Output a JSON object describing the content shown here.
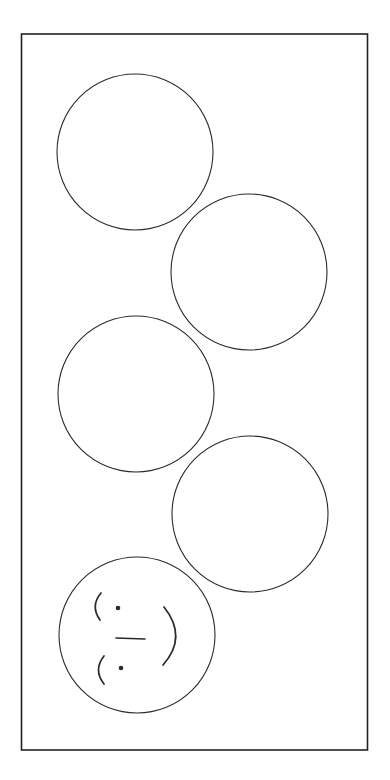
{
  "colors": {
    "background": "#ffffff",
    "stroke": "#2a2a2a",
    "frame_stroke": "#222222"
  },
  "frame": {
    "x": 21.5,
    "y": 34,
    "width": 346,
    "height": 716,
    "stroke_width": 1.6
  },
  "circles": [
    {
      "id": "circle-1",
      "cx": 135,
      "cy": 152,
      "r": 78
    },
    {
      "id": "circle-2",
      "cx": 249,
      "cy": 272,
      "r": 78
    },
    {
      "id": "circle-3",
      "cx": 136,
      "cy": 394,
      "r": 78
    },
    {
      "id": "circle-4",
      "cx": 250,
      "cy": 514,
      "r": 78
    }
  ],
  "face": {
    "circle": {
      "cx": 137,
      "cy": 635,
      "r": 78
    },
    "upper_eye_dot": {
      "cx": 118,
      "cy": 608,
      "r": 2.3
    },
    "lower_eye_dot": {
      "cx": 121,
      "cy": 668,
      "r": 2.3
    },
    "upper_brow_path": "M 101 593 Q 90 606 100 620",
    "lower_brow_path": "M 104 656 Q 93 670 104 684",
    "nose_dash": {
      "x1": 116,
      "y1": 638,
      "x2": 145,
      "y2": 639
    },
    "mouth_path": "M 164 607 Q 188 637 163 665"
  }
}
